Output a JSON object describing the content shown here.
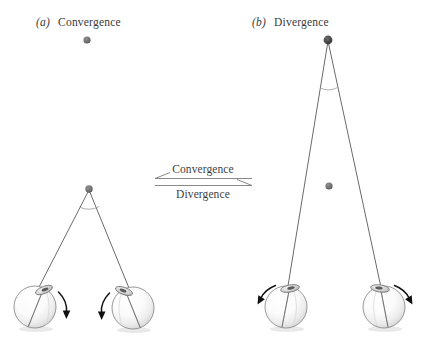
{
  "figure": {
    "background_color": "#ffffff",
    "width": 422,
    "height": 344
  },
  "panels": [
    {
      "id": "a",
      "index_label": "(a)",
      "title": "Convergence",
      "label_x": 36,
      "label_y": 26,
      "fixation_point": {
        "name": "near-fixation-point",
        "x": 89,
        "y": 189,
        "r": 3.6,
        "color": "#6f6f6f"
      },
      "other_point": {
        "name": "far-target-point",
        "x": 87,
        "y": 40,
        "r": 3.6,
        "color": "#6f6f6f"
      },
      "vergence_arc": {
        "cx": 89,
        "cy": 189,
        "r": 20,
        "color": "#9a9a9a"
      },
      "eyes": [
        {
          "name": "left-eye",
          "cx": 35,
          "cy": 307,
          "r": 21,
          "cornea_angle_deg": -22,
          "rotation": "clockwise",
          "rotation_arrow": {
            "cx": 35,
            "cy": 307,
            "start_deg": -58,
            "end_deg": 22,
            "color": "#111111"
          }
        },
        {
          "name": "right-eye",
          "cx": 133,
          "cy": 308,
          "r": 21,
          "cornea_angle_deg": 20,
          "rotation": "counterclockwise",
          "rotation_arrow": {
            "cx": 133,
            "cy": 308,
            "start_deg": -122,
            "end_deg": -202,
            "color": "#111111"
          }
        }
      ]
    },
    {
      "id": "b",
      "index_label": "(b)",
      "title": "Divergence",
      "label_x": 252,
      "label_y": 26,
      "fixation_point": {
        "name": "near-fixation-point",
        "x": 328,
        "y": 40,
        "r": 4.2,
        "color": "#4a4a4a"
      },
      "other_point": {
        "name": "far-target-point",
        "x": 329,
        "y": 186,
        "r": 3.6,
        "color": "#6f6f6f"
      },
      "vergence_arc": {
        "cx": 328,
        "cy": 40,
        "r": 48,
        "color": "#9a9a9a"
      },
      "eyes": [
        {
          "name": "left-eye",
          "cx": 286,
          "cy": 307,
          "r": 21,
          "cornea_angle_deg": -10,
          "rotation": "counterclockwise",
          "rotation_arrow": {
            "cx": 286,
            "cy": 307,
            "start_deg": -40,
            "end_deg": -125,
            "color": "#111111"
          }
        },
        {
          "name": "right-eye",
          "cx": 384,
          "cy": 307,
          "r": 21,
          "cornea_angle_deg": 8,
          "rotation": "clockwise",
          "rotation_arrow": {
            "cx": 384,
            "cy": 307,
            "start_deg": -140,
            "end_deg": -55,
            "color": "#111111"
          }
        }
      ]
    }
  ],
  "transition": {
    "name": "vergence-transition-arrows",
    "top_label": "Convergence",
    "bottom_label": "Divergence",
    "top_direction": "left",
    "bottom_direction": "right",
    "top_line": {
      "x1": 155,
      "y1": 178,
      "x2": 252,
      "y2": 178
    },
    "bottom_line": {
      "x1": 155,
      "y1": 185,
      "x2": 252,
      "y2": 185
    },
    "top_label_x": 203,
    "top_label_y": 172,
    "bottom_label_x": 203,
    "bottom_label_y": 198,
    "line_color": "#7a7a7a"
  },
  "colors": {
    "gaze_line": "#6b6b6b",
    "arc": "#9a9a9a",
    "text": "#3a3a3a",
    "arrow_black": "#111111",
    "sphere_light": "#ffffff",
    "sphere_mid": "#ededed",
    "sphere_shadow": "#c9c9c9",
    "sphere_outline": "#8d8d8d"
  }
}
